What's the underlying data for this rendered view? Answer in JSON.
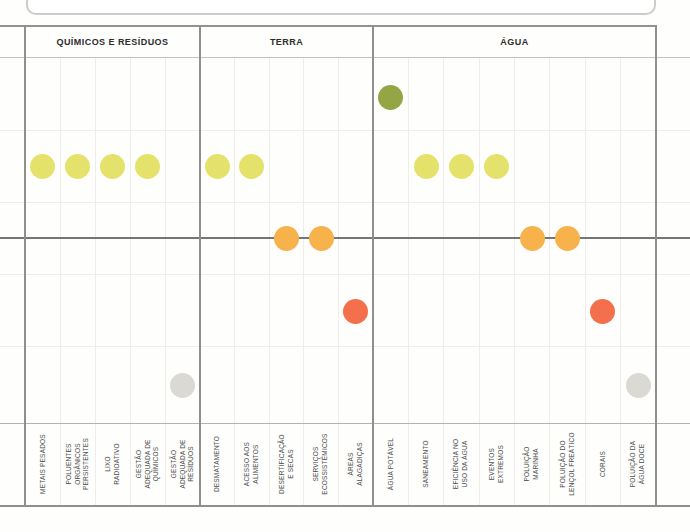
{
  "chart_data": {
    "type": "scatter",
    "title": "",
    "subtitle": "",
    "legend_position": "none",
    "grid": true,
    "level_axis": {
      "description": "discrete vertical status level per topic, zero line emphasized",
      "range": [
        -2,
        2
      ],
      "zero_line": true
    },
    "colors_by_level": {
      "2": "#93a545",
      "1": "#e5e26b",
      "0": "#f7b24b",
      "-1": "#f46f4b",
      "-2": "#dbd9d3"
    },
    "groups": [
      {
        "label": "QUÍMICOS E RESÍDUOS",
        "topics": [
          {
            "label": "METAIS PESADOS",
            "level": 1,
            "dot_color": "#e5e26b"
          },
          {
            "label": "POLUENTES\nORGÂNICOS\nPERSISTENTES",
            "level": 1,
            "dot_color": "#e5e26b"
          },
          {
            "label": "LIXO\nRADIOATIVO",
            "level": 1,
            "dot_color": "#e5e26b"
          },
          {
            "label": "GESTÃO\nADEQUADA DE\nQUÍMICOS",
            "level": 1,
            "dot_color": "#e5e26b"
          },
          {
            "label": "GESTÃO\nADEQUADA DE\nRESÍDUOS",
            "level": -2,
            "dot_color": "#dbd9d3"
          }
        ]
      },
      {
        "label": "TERRA",
        "topics": [
          {
            "label": "DESMATAMENTO",
            "level": 1,
            "dot_color": "#e5e26b"
          },
          {
            "label": "ACESSO AOS\nALIMENTOS",
            "level": 1,
            "dot_color": "#e5e26b"
          },
          {
            "label": "DESERTIFICAÇÃO\nE SECAS",
            "level": 0,
            "dot_color": "#f7b24b"
          },
          {
            "label": "SERVIÇOS\nECOSSISTÊMICOS",
            "level": 0,
            "dot_color": "#f7b24b"
          },
          {
            "label": "ÁREAS\nALAGADIÇAS",
            "level": -1,
            "dot_color": "#f46f4b"
          }
        ]
      },
      {
        "label": "ÁGUA",
        "topics": [
          {
            "label": "ÁGUA POTÁVEL",
            "level": 2,
            "dot_color": "#93a545"
          },
          {
            "label": "SANEAMENTO",
            "level": 1,
            "dot_color": "#e5e26b"
          },
          {
            "label": "EFICIÊNCIA NO\nUSO DA ÁGUA",
            "level": 1,
            "dot_color": "#e5e26b"
          },
          {
            "label": "EVENTOS\nEXTREMOS",
            "level": 1,
            "dot_color": "#e5e26b"
          },
          {
            "label": "POLUIÇÃO\nMARINHA",
            "level": 0,
            "dot_color": "#f7b24b"
          },
          {
            "label": "POLUIÇÃO DO\nLENÇOL FREÁTICO",
            "level": 0,
            "dot_color": "#f7b24b"
          },
          {
            "label": "CORAIS",
            "level": -1,
            "dot_color": "#f46f4b"
          },
          {
            "label": "POLUIÇÃO DA\nÁGUA DOCE",
            "level": -2,
            "dot_color": "#dbd9d3"
          }
        ]
      }
    ]
  }
}
